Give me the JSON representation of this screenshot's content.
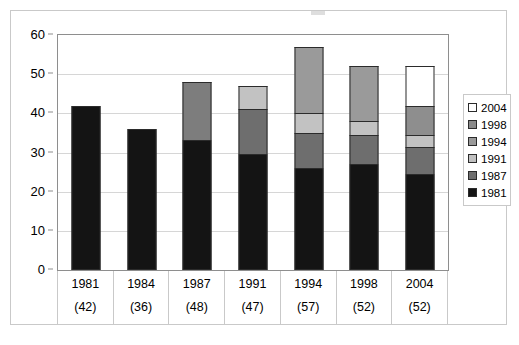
{
  "chart_data": {
    "type": "bar",
    "stacked": true,
    "title": "",
    "subtitle": "",
    "xlabel": "",
    "ylabel": "",
    "ylim": [
      0,
      60
    ],
    "ytick_step": 10,
    "yticks": [
      "0",
      "10",
      "20",
      "30",
      "40",
      "50",
      "60"
    ],
    "grid": true,
    "legend_position": "right",
    "categories": [
      "1981",
      "1984",
      "1987",
      "1991",
      "1994",
      "1998",
      "2004"
    ],
    "category_totals": [
      "(42)",
      "(36)",
      "(48)",
      "(47)",
      "(57)",
      "(52)",
      "(52)"
    ],
    "totals": [
      42,
      36,
      48,
      47,
      57,
      52,
      52
    ],
    "series": [
      {
        "name": "1981",
        "color": "#141414",
        "values": [
          42,
          36,
          33.3,
          29.5,
          26,
          27,
          24.5
        ]
      },
      {
        "name": "1987",
        "color": "#6e6e6e",
        "values": [
          0,
          0,
          14.7,
          11.5,
          9,
          7.5,
          7
        ]
      },
      {
        "name": "1991",
        "color": "#c0c0c0",
        "values": [
          0,
          0,
          0,
          6,
          5,
          3.5,
          3
        ]
      },
      {
        "name": "1994",
        "color": "#9a9a9a",
        "values": [
          0,
          0,
          0,
          0,
          17,
          14,
          7.5
        ]
      },
      {
        "name": "1998",
        "color": "#8a8a8a",
        "values": [
          0,
          0,
          0,
          0,
          0,
          0,
          0
        ]
      },
      {
        "name": "2004",
        "color": "#ffffff",
        "values": [
          0,
          0,
          0,
          0,
          0,
          0,
          10
        ]
      }
    ],
    "legend": [
      {
        "label": "2004",
        "color": "#ffffff"
      },
      {
        "label": "1998",
        "color": "#8a8a8a"
      },
      {
        "label": "1994",
        "color": "#9a9a9a"
      },
      {
        "label": "1991",
        "color": "#c0c0c0"
      },
      {
        "label": "1987",
        "color": "#6e6e6e"
      },
      {
        "label": "1981",
        "color": "#141414"
      }
    ],
    "bar_stacks": [
      {
        "category": "1981",
        "total": 42,
        "segments": [
          {
            "series": "1981",
            "from": 0,
            "to": 42,
            "color": "#141414"
          }
        ]
      },
      {
        "category": "1984",
        "total": 36,
        "segments": [
          {
            "series": "1981",
            "from": 0,
            "to": 36,
            "color": "#141414"
          }
        ]
      },
      {
        "category": "1987",
        "total": 48,
        "segments": [
          {
            "series": "1981",
            "from": 0,
            "to": 33.3,
            "color": "#141414"
          },
          {
            "series": "1987",
            "from": 33.3,
            "to": 48,
            "color": "#7d7d7d"
          }
        ]
      },
      {
        "category": "1991",
        "total": 47,
        "segments": [
          {
            "series": "1981",
            "from": 0,
            "to": 29.5,
            "color": "#141414"
          },
          {
            "series": "1987",
            "from": 29.5,
            "to": 41,
            "color": "#6e6e6e"
          },
          {
            "series": "1991",
            "from": 41,
            "to": 47,
            "color": "#c2c2c2"
          }
        ]
      },
      {
        "category": "1994",
        "total": 57,
        "segments": [
          {
            "series": "1981",
            "from": 0,
            "to": 26,
            "color": "#141414"
          },
          {
            "series": "1987",
            "from": 26,
            "to": 35,
            "color": "#6e6e6e"
          },
          {
            "series": "1991",
            "from": 35,
            "to": 40,
            "color": "#c2c2c2"
          },
          {
            "series": "1994",
            "from": 40,
            "to": 57,
            "color": "#9a9a9a"
          }
        ]
      },
      {
        "category": "1998",
        "total": 52,
        "segments": [
          {
            "series": "1981",
            "from": 0,
            "to": 27,
            "color": "#141414"
          },
          {
            "series": "1987",
            "from": 27,
            "to": 34.5,
            "color": "#6e6e6e"
          },
          {
            "series": "1991",
            "from": 34.5,
            "to": 38,
            "color": "#c2c2c2"
          },
          {
            "series": "1994",
            "from": 38,
            "to": 52,
            "color": "#9a9a9a"
          }
        ]
      },
      {
        "category": "2004",
        "total": 52,
        "segments": [
          {
            "series": "1981",
            "from": 0,
            "to": 24.5,
            "color": "#141414"
          },
          {
            "series": "1987",
            "from": 24.5,
            "to": 31.5,
            "color": "#6e6e6e"
          },
          {
            "series": "1991",
            "from": 31.5,
            "to": 34.5,
            "color": "#c2c2c2"
          },
          {
            "series": "1994",
            "from": 34.5,
            "to": 42,
            "color": "#8e8e8e"
          },
          {
            "series": "2004",
            "from": 42,
            "to": 52,
            "color": "#ffffff"
          }
        ]
      }
    ]
  }
}
